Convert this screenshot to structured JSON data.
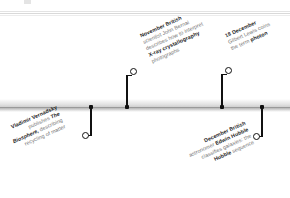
{
  "figure": {
    "name": "science-timeline-1926",
    "orientation": "horizontal",
    "colors": {
      "bar_light": "#efefef",
      "bar_dark": "#bdbdbd",
      "bar_line": "#9a9a9a",
      "marker": "#111111",
      "text_body": "#6f6f6f",
      "text_emphasis": "#1d1d1d",
      "background": "#ffffff"
    }
  },
  "events": [
    {
      "id": "vernadsky",
      "side": "below",
      "date": "",
      "lines": [
        "Vladimir Vernadsky",
        "publishes The",
        "Biosphere, describing",
        "recycling of matter"
      ],
      "emphasis_lead": "Vladimir Vernadsky",
      "subject": "Vladimir Vernadsky",
      "work": "The Biosphere",
      "summary": "Vladimir Vernadsky publishes The Biosphere, describing recycling of matter"
    },
    {
      "id": "bernal",
      "side": "above",
      "date": "November",
      "lines": [
        "November British",
        "scientist John Bernal",
        "describes how to interpret",
        "X-ray crystallography",
        "photographs"
      ],
      "emphasis_lead": "November",
      "subject": "John Bernal",
      "summary": "November British scientist John Bernal describes how to interpret X-ray crystallography photographs"
    },
    {
      "id": "lewis",
      "side": "above",
      "date": "18 December",
      "lines": [
        "18 December",
        "Gilbert Lewis coins",
        "the term photon"
      ],
      "emphasis_lead": "18 December",
      "subject": "Gilbert Lewis",
      "term": "photon",
      "summary": "18 December Gilbert Lewis coins the term photon"
    },
    {
      "id": "hubble",
      "side": "below",
      "date": "December",
      "lines": [
        "December British",
        "astronomer Edwin Hubble",
        "classifies galaxies: the",
        "Hubble sequence"
      ],
      "emphasis_lead": "December",
      "subject": "Edwin Hubble",
      "summary": "December British astronomer Edwin Hubble classifies galaxies: the Hubble sequence"
    }
  ]
}
